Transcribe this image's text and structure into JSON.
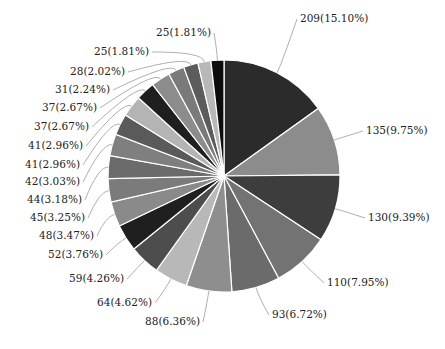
{
  "chart_data": {
    "type": "pie",
    "title": "",
    "start_angle_deg": 0,
    "direction": "clockwise",
    "center": [
      224,
      176
    ],
    "radius": 116,
    "total": 1384,
    "slices": [
      {
        "value": 209,
        "percent": "15.10%",
        "label": "209(15.10%)",
        "color": "#2b2b2b",
        "lx": 300,
        "ly": 22,
        "anchor": "start"
      },
      {
        "value": 135,
        "percent": "9.75%",
        "label": "135(9.75%)",
        "color": "#8c8c8c",
        "lx": 366,
        "ly": 134,
        "anchor": "start"
      },
      {
        "value": 130,
        "percent": "9.39%",
        "label": "130(9.39%)",
        "color": "#3d3d3d",
        "lx": 368,
        "ly": 221,
        "anchor": "start"
      },
      {
        "value": 110,
        "percent": "7.95%",
        "label": "110(7.95%)",
        "color": "#737373",
        "lx": 327,
        "ly": 286,
        "anchor": "start"
      },
      {
        "value": 93,
        "percent": "6.72%",
        "label": "93(6.72%)",
        "color": "#6b6b6b",
        "lx": 272,
        "ly": 318,
        "anchor": "start"
      },
      {
        "value": 88,
        "percent": "6.36%",
        "label": "88(6.36%)",
        "color": "#8e8e8e",
        "lx": 200,
        "ly": 325,
        "anchor": "end"
      },
      {
        "value": 64,
        "percent": "4.62%",
        "label": "64(4.62%)",
        "color": "#b8b8b8",
        "lx": 152,
        "ly": 306,
        "anchor": "end"
      },
      {
        "value": 59,
        "percent": "4.26%",
        "label": "59(4.26%)",
        "color": "#4d4d4d",
        "lx": 124,
        "ly": 282,
        "anchor": "end"
      },
      {
        "value": 52,
        "percent": "3.76%",
        "label": "52(3.76%)",
        "color": "#1f1f1f",
        "lx": 103,
        "ly": 258,
        "anchor": "end"
      },
      {
        "value": 48,
        "percent": "3.47%",
        "label": "48(3.47%)",
        "color": "#8a8a8a",
        "lx": 94,
        "ly": 239,
        "anchor": "end"
      },
      {
        "value": 45,
        "percent": "3.25%",
        "label": "45(3.25%)",
        "color": "#7b7b7b",
        "lx": 85,
        "ly": 221,
        "anchor": "end"
      },
      {
        "value": 44,
        "percent": "3.18%",
        "label": "44(3.18%)",
        "color": "#6b6b6b",
        "lx": 82,
        "ly": 203,
        "anchor": "end"
      },
      {
        "value": 42,
        "percent": "3.03%",
        "label": "42(3.03%)",
        "color": "#7f7f7f",
        "lx": 80,
        "ly": 185,
        "anchor": "end"
      },
      {
        "value": 41,
        "percent": "2.96%",
        "label": "41(2.96%)",
        "color": "#5a5a5a",
        "lx": 80,
        "ly": 168,
        "anchor": "end"
      },
      {
        "value": 41,
        "percent": "2.96%",
        "label": "41(2.96%)",
        "color": "#b4b4b4",
        "lx": 83,
        "ly": 149,
        "anchor": "end"
      },
      {
        "value": 37,
        "percent": "2.67%",
        "label": "37(2.67%)",
        "color": "#1f1f1f",
        "lx": 89,
        "ly": 130,
        "anchor": "end"
      },
      {
        "value": 37,
        "percent": "2.67%",
        "label": "37(2.67%)",
        "color": "#8c8c8c",
        "lx": 97,
        "ly": 111,
        "anchor": "end"
      },
      {
        "value": 31,
        "percent": "2.24%",
        "label": "31(2.24%)",
        "color": "#7a7a7a",
        "lx": 110,
        "ly": 93,
        "anchor": "end"
      },
      {
        "value": 28,
        "percent": "2.02%",
        "label": "28(2.02%)",
        "color": "#5c5c5c",
        "lx": 125,
        "ly": 75,
        "anchor": "end"
      },
      {
        "value": 25,
        "percent": "1.81%",
        "label": "25(1.81%)",
        "color": "#b8b8b8",
        "lx": 149,
        "ly": 55,
        "anchor": "end"
      },
      {
        "value": 25,
        "percent": "1.81%",
        "label": "25(1.81%)",
        "color": "#0d0d0d",
        "lx": 211,
        "ly": 36,
        "anchor": "end"
      }
    ],
    "legend": null,
    "grid": false
  }
}
